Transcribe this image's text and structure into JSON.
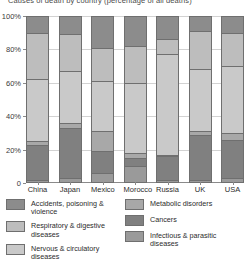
{
  "chart_data": {
    "type": "bar",
    "subtype": "100% stacked bar",
    "title": "Causes of death by country (percentage of all deaths)",
    "xlabel": "",
    "ylabel": "",
    "ylim": [
      0,
      100
    ],
    "yticks": [
      "0",
      "20%",
      "40%",
      "60%",
      "80%",
      "100%"
    ],
    "ytick_values": [
      0,
      20,
      40,
      60,
      80,
      100
    ],
    "grid": true,
    "legend_position": "bottom",
    "categories": [
      "China",
      "Japan",
      "Mexico",
      "Morocco",
      "Russia",
      "UK",
      "USA"
    ],
    "series": [
      {
        "name": "Infectious & parasitic diseases",
        "color": "#9a9a9a",
        "values": [
          2,
          3,
          6,
          10,
          2,
          2,
          3
        ]
      },
      {
        "name": "Cancers",
        "color": "#808080",
        "values": [
          21,
          30,
          13,
          5,
          14,
          27,
          23
        ]
      },
      {
        "name": "Metabolic disorders",
        "color": "#a8a8a8",
        "values": [
          2,
          3,
          12,
          3,
          1,
          2,
          4
        ]
      },
      {
        "name": "Nervous & circulatory diseases",
        "color": "#c9c9c9",
        "values": [
          37,
          31,
          30,
          42,
          60,
          37,
          40
        ]
      },
      {
        "name": "Respiratory & digestive diseases",
        "color": "#bdbdbd",
        "values": [
          28,
          22,
          20,
          22,
          9,
          23,
          20
        ]
      },
      {
        "name": "Accidents, poisoning & violence",
        "color": "#8c8c8c",
        "values": [
          10,
          11,
          19,
          18,
          14,
          9,
          10
        ]
      }
    ],
    "stack_order_bottom_to_top": [
      "Infectious & parasitic diseases",
      "Cancers",
      "Metabolic disorders",
      "Nervous & circulatory diseases",
      "Respiratory & digestive diseases",
      "Accidents, poisoning & violence"
    ]
  },
  "legend": {
    "left_column": [
      {
        "label": "Accidents, poisoning & violence",
        "color": "#8c8c8c"
      },
      {
        "label": "Respiratory & digestive diseases",
        "color": "#bdbdbd"
      },
      {
        "label": "Nervous & circulatory diseases",
        "color": "#c9c9c9"
      }
    ],
    "right_column": [
      {
        "label": "Metabolic disorders",
        "color": "#a8a8a8"
      },
      {
        "label": "Cancers",
        "color": "#808080"
      },
      {
        "label": "Infectious & parasitic diseases",
        "color": "#9a9a9a"
      }
    ]
  },
  "colors": {
    "axis": "#8a8a8a",
    "grid": "#d2d2d2",
    "segment_border": "#6f6f6f",
    "text": "#2b2b2b",
    "background": "#ffffff"
  }
}
